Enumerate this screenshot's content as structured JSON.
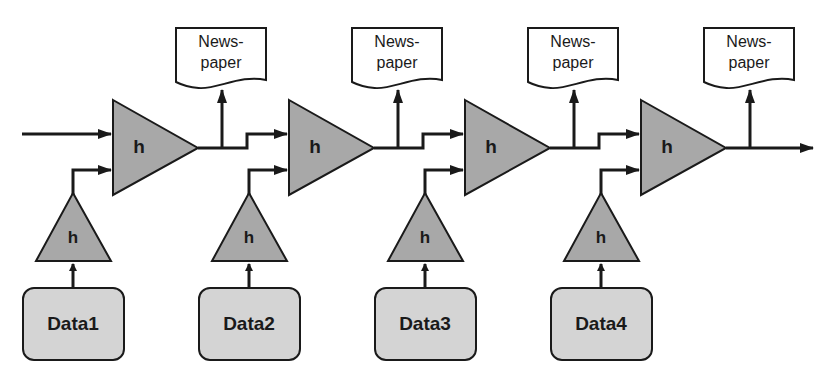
{
  "diagram": {
    "type": "pipeline",
    "colors": {
      "triangle_fill": "#a8a8a8",
      "data_fill": "#d4d4d4",
      "stroke": "#1a1a1a",
      "background": "#ffffff"
    },
    "stages": [
      {
        "main_label": "h",
        "feeder_label": "h",
        "data_label": "Data1",
        "output_label": "News-\npaper",
        "output_line1": "News-",
        "output_line2": "paper"
      },
      {
        "main_label": "h",
        "feeder_label": "h",
        "data_label": "Data2",
        "output_label": "News-\npaper",
        "output_line1": "News-",
        "output_line2": "paper"
      },
      {
        "main_label": "h",
        "feeder_label": "h",
        "data_label": "Data3",
        "output_label": "News-\npaper",
        "output_line1": "News-",
        "output_line2": "paper"
      },
      {
        "main_label": "h",
        "feeder_label": "h",
        "data_label": "Data4",
        "output_label": "News-\npaper",
        "output_line1": "News-",
        "output_line2": "paper"
      }
    ]
  }
}
